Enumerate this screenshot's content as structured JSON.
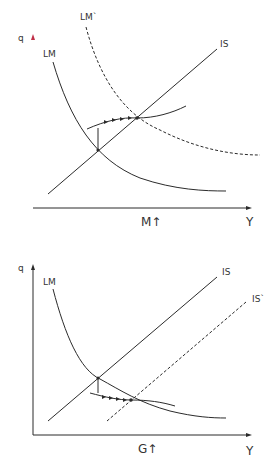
{
  "diagrams": [
    {
      "id": "monetary-expansion",
      "axes": {
        "y_label": "q",
        "x_label": "Y"
      },
      "curves": {
        "lm": "LM",
        "lm_shifted": "LM`",
        "is": "IS"
      },
      "shock_label": "M↑",
      "colors": {
        "y_axis_top": "#d9485f",
        "y_axis_bottom": "#3fa88a",
        "line": "#2b2b2b"
      }
    },
    {
      "id": "fiscal-expansion",
      "axes": {
        "y_label": "q",
        "x_label": "Y"
      },
      "curves": {
        "lm": "LM",
        "is": "IS",
        "is_shifted": "IS`"
      },
      "shock_label": "G↑",
      "colors": {
        "line": "#2b2b2b"
      }
    }
  ]
}
